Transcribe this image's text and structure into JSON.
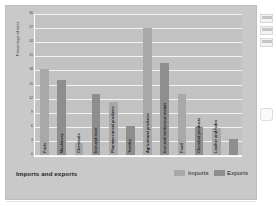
{
  "figure": {
    "legend_title": "Imports and exports",
    "y_axis_title": "Percentage of total"
  },
  "chart_data": {
    "type": "bar",
    "title": "Imports and exports",
    "xlabel": "",
    "ylabel": "Percentage of total",
    "ylim": [
      0,
      30
    ],
    "yticks": [
      0,
      3,
      6,
      9,
      12,
      15,
      18,
      21,
      24,
      27,
      30
    ],
    "grid": true,
    "legend_position": "bottom-right",
    "legend": [
      "Imports",
      "Exports"
    ],
    "categories": [
      "Fuels",
      "Machinery",
      "Chemicals",
      "Iron and steel",
      "Pharmaceutical products",
      "Textiles",
      "Agricultural products",
      "Iron and nonferrous metals",
      "Food",
      "Chemical products",
      "Leather and hides"
    ],
    "bars": [
      {
        "label": "Fuels",
        "series": "Imports",
        "value": 18.2
      },
      {
        "label": "Machinery",
        "series": "Exports",
        "value": 16.0
      },
      {
        "label": "Chemicals",
        "series": "Imports",
        "value": 2.6
      },
      {
        "label": "Iron and steel",
        "series": "Exports",
        "value": 13.0
      },
      {
        "label": "Pharmaceutical products",
        "series": "Imports",
        "value": 11.2
      },
      {
        "label": "Textiles",
        "series": "Exports",
        "value": 6.2
      },
      {
        "label": "Agricultural products",
        "series": "Imports",
        "value": 27.0
      },
      {
        "label": "Iron and nonferrous metals",
        "series": "Exports",
        "value": 19.6
      },
      {
        "label": "Food",
        "series": "Imports",
        "value": 13.0
      },
      {
        "label": "Chemical products",
        "series": "Exports",
        "value": 6.0
      },
      {
        "label": "Leather and hides",
        "series": "Imports",
        "value": 5.7
      },
      {
        "label": "",
        "series": "Exports",
        "value": 3.4
      }
    ],
    "series": [
      {
        "name": "Imports",
        "color": "#a8a8a8"
      },
      {
        "name": "Exports",
        "color": "#8e8e8e"
      }
    ]
  }
}
